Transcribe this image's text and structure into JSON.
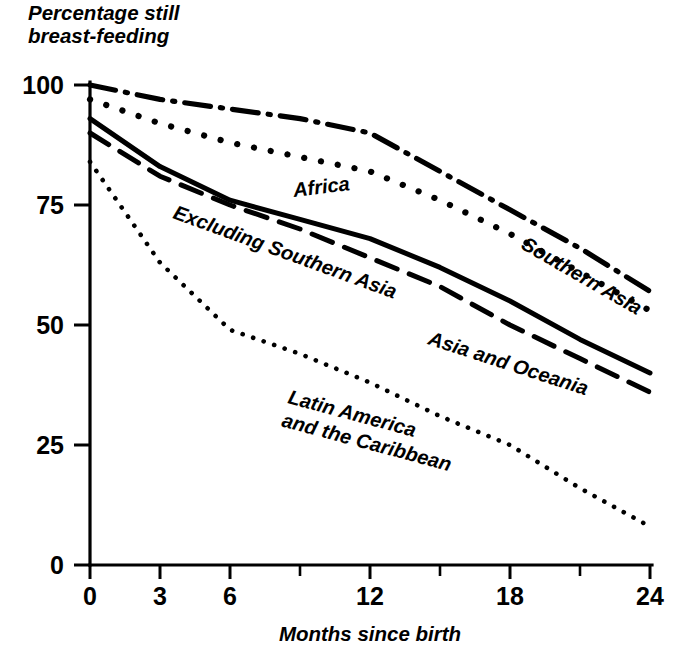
{
  "chart_data": {
    "type": "line",
    "title": "Percentage still breast-feeding",
    "title_line1": "Percentage still",
    "title_line2": "breast-feeding",
    "xlabel": "Months since birth",
    "ylabel": "Percentage still breast-feeding",
    "xlim": [
      0,
      24
    ],
    "ylim": [
      0,
      100
    ],
    "xticks": [
      0,
      3,
      6,
      9,
      12,
      15,
      18,
      21,
      24
    ],
    "xtick_labels": [
      "0",
      "3",
      "6",
      "",
      "12",
      "",
      "18",
      "",
      "24"
    ],
    "yticks": [
      0,
      25,
      50,
      75,
      100
    ],
    "ytick_labels": [
      "0",
      "25",
      "50",
      "75",
      "100"
    ],
    "grid": false,
    "legend": "inline-labels",
    "x": [
      0,
      3,
      6,
      9,
      12,
      15,
      18,
      21,
      24
    ],
    "series": [
      {
        "name": "Southern Asia",
        "style": "dashdot",
        "label_x": 520,
        "label_y": 248,
        "label_rotate": 30,
        "values": [
          100,
          97,
          95,
          93,
          90,
          82,
          74,
          66,
          57
        ]
      },
      {
        "name": "Africa",
        "style": "dotted-coarse",
        "label_x": 294,
        "label_y": 197,
        "label_rotate": -7,
        "values": [
          97,
          92,
          88,
          85,
          82,
          76,
          69,
          61,
          53
        ]
      },
      {
        "name": "Asia and Oceania",
        "style": "solid",
        "label_x": 427,
        "label_y": 344,
        "label_rotate": 18,
        "values": [
          93,
          83,
          76,
          72,
          68,
          62,
          55,
          47,
          40
        ]
      },
      {
        "name": "Excluding Southern Asia",
        "style": "dashed-long",
        "label_x": 172,
        "label_y": 218,
        "label_rotate": 20,
        "values": [
          90,
          81,
          75,
          70,
          64,
          58,
          50,
          43,
          36
        ]
      },
      {
        "name": "Latin America and the Caribbean",
        "label_line1": "Latin America",
        "label_line2": "and the Caribbean",
        "style": "dotted-fine",
        "label_x": 287,
        "label_y": 403,
        "label_rotate": 15,
        "values": [
          84,
          63,
          49,
          44,
          38,
          31,
          25,
          16,
          8
        ]
      }
    ]
  }
}
